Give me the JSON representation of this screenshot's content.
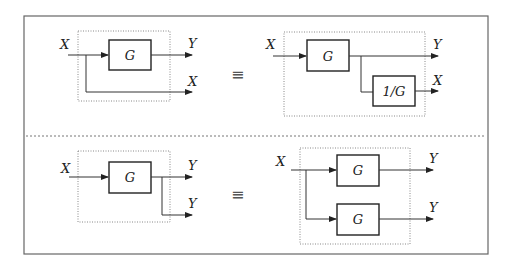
{
  "figure": {
    "top_panel": {
      "left": {
        "input_label": "X",
        "block_label": "G",
        "output_label_1": "Y",
        "output_label_2": "X"
      },
      "equivalence_symbol": "≡",
      "right": {
        "input_label": "X",
        "block_label": "G",
        "inverse_block_label": "1/G",
        "output_label_1": "Y",
        "output_label_2": "X"
      }
    },
    "bottom_panel": {
      "left": {
        "input_label": "X",
        "block_label": "G",
        "output_label_1": "Y",
        "output_label_2": "Y"
      },
      "equivalence_symbol": "≡",
      "right": {
        "input_label": "X",
        "block_label_1": "G",
        "block_label_2": "G",
        "output_label_1": "Y",
        "output_label_2": "Y"
      }
    }
  },
  "colors": {
    "line": "#333333",
    "frame": "#666666",
    "dotted": "#888888"
  }
}
